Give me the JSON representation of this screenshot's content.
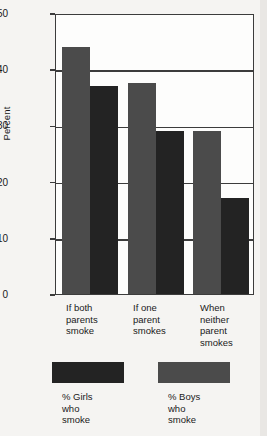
{
  "chart_data": {
    "type": "bar",
    "title": "",
    "xlabel": "",
    "ylabel": "Percent",
    "ylim": [
      0,
      50
    ],
    "yticks": [
      0,
      10,
      20,
      30,
      40,
      50
    ],
    "ytick_labels": [
      "0",
      "10",
      "20",
      "30",
      "40",
      "50"
    ],
    "grid": true,
    "legend_position": "below",
    "categories": [
      "If both\nparents\nsmoke",
      "If one\nparent\nsmokes",
      "When\nneither\nparent\nsmokes"
    ],
    "series": [
      {
        "name": "% Boys\nwho\nsmoke",
        "key": "boys",
        "color": "#4b4b4b",
        "values": [
          44,
          37.5,
          29
        ]
      },
      {
        "name": "% Girls\nwho\nsmoke",
        "key": "girls",
        "color": "#232323",
        "values": [
          37,
          29,
          17
        ]
      }
    ]
  },
  "legend": {
    "items": [
      {
        "label": "% Girls\nwho\nsmoke",
        "series": "girls"
      },
      {
        "label": "% Boys\nwho\nsmoke",
        "series": "boys"
      }
    ]
  }
}
